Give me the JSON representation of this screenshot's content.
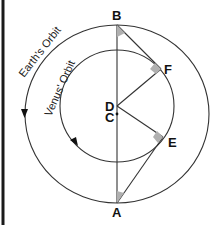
{
  "diagram": {
    "type": "orbital-geometry",
    "points": {
      "A": {
        "label": "A"
      },
      "B": {
        "label": "B"
      },
      "C": {
        "label": "C"
      },
      "D": {
        "label": "D"
      },
      "E": {
        "label": "E"
      },
      "F": {
        "label": "F"
      }
    },
    "orbits": {
      "earth": {
        "label": "Earth's Orbit"
      },
      "venus": {
        "label": "Venus' Orbit"
      }
    },
    "colors": {
      "line": "#333333",
      "right_angle_marker": "#b0b0b0",
      "border": "#1a1a1a"
    }
  }
}
